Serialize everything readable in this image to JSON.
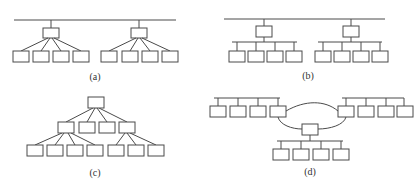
{
  "figure": {
    "panels": [
      {
        "id": "a",
        "label": "(a)",
        "topology": "bus backbone with two star hubs, 4 nodes each"
      },
      {
        "id": "b",
        "label": "(b)",
        "topology": "bus backbone with two hubs, each feeding a sub-bus of 4 nodes"
      },
      {
        "id": "c",
        "label": "(c)",
        "topology": "tree: root, 4 second-level nodes, 7 leaf nodes"
      },
      {
        "id": "d",
        "label": "(d)",
        "topology": "ring connecting three bus segments of 4 nodes each"
      }
    ],
    "colors": {
      "line": "#4a4a4a",
      "box_fill": "#ffffff",
      "background": "#ffffff"
    }
  }
}
